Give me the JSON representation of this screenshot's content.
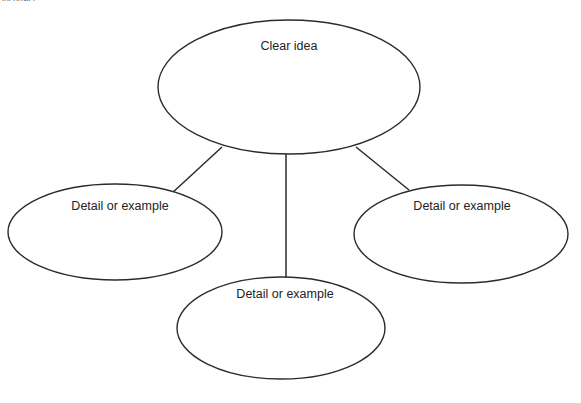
{
  "page": {
    "width": 581,
    "height": 403,
    "background_color": "#ffffff",
    "clipped_caption_text": "incorrect."
  },
  "style": {
    "stroke_color": "#2b2b2b",
    "text_color": "#232323",
    "shape_fill": "#ffffff"
  },
  "diagram": {
    "type": "cluster-diagram",
    "shape_kind": "ellipse",
    "nodes": [
      {
        "id": "central",
        "label": "Clear idea",
        "role": "central-idea",
        "cx": 289,
        "cy": 87,
        "rx": 131,
        "ry": 67,
        "label_x": 289,
        "label_y": 47
      },
      {
        "id": "detail-left",
        "label": "Detail or example",
        "role": "supporting-detail",
        "cx": 115,
        "cy": 232,
        "rx": 107,
        "ry": 48,
        "label_x": 120,
        "label_y": 207
      },
      {
        "id": "detail-right",
        "label": "Detail or example",
        "role": "supporting-detail",
        "cx": 461,
        "cy": 234,
        "rx": 107,
        "ry": 49,
        "label_x": 462,
        "label_y": 207
      },
      {
        "id": "detail-bottom",
        "label": "Detail or example",
        "role": "supporting-detail",
        "cx": 281,
        "cy": 328,
        "rx": 104,
        "ry": 51,
        "label_x": 285,
        "label_y": 295
      }
    ],
    "connectors": [
      {
        "id": "central-to-left",
        "from": "central",
        "to": "detail-left",
        "x1": 222,
        "y1": 147,
        "x2": 171,
        "y2": 194
      },
      {
        "id": "central-to-bottom",
        "from": "central",
        "to": "detail-bottom",
        "x1": 286,
        "y1": 154,
        "x2": 286,
        "y2": 286
      },
      {
        "id": "central-to-right",
        "from": "central",
        "to": "detail-right",
        "x1": 356,
        "y1": 147,
        "x2": 409,
        "y2": 190
      }
    ]
  }
}
